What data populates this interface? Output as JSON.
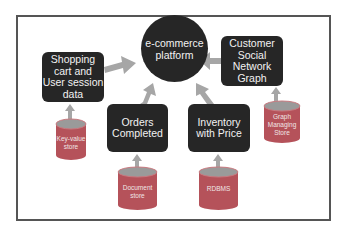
{
  "diagram": {
    "center": {
      "label": "e-commerce\nplatform"
    },
    "boxes": {
      "shopping": {
        "label": "Shopping\ncart and\nUser session\ndata"
      },
      "customer": {
        "label": "Customer\nSocial\nNetwork\nGraph"
      },
      "orders": {
        "label": "Orders\nCompleted"
      },
      "inventory": {
        "label": "Inventory\nwith Price"
      }
    },
    "stores": {
      "keyvalue": {
        "label": "Key-value\nstore"
      },
      "graph": {
        "label": "Graph\nManaging\nStore"
      },
      "document": {
        "label": "Document\nstore"
      },
      "rdbms": {
        "label": "RDBMS"
      }
    },
    "colors": {
      "node_fill": "#262626",
      "node_text": "#f2f2f2",
      "store_fill": "#b5525a",
      "store_top": "#9a9a9a",
      "arrow": "#a6a6a6",
      "frame": "#555555"
    }
  }
}
